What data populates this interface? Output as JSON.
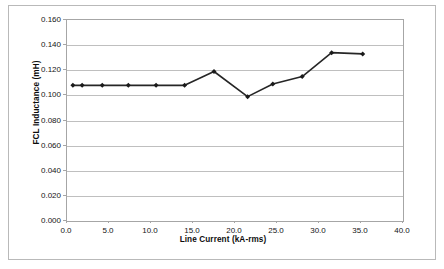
{
  "chart_data": {
    "type": "line",
    "title": "",
    "xlabel": "Line Current (kA-rms)",
    "ylabel": "FCL Inductance (mH)",
    "xlim": [
      0.0,
      40.0
    ],
    "ylim": [
      0.0,
      0.16
    ],
    "xticks": [
      "0.0",
      "5.0",
      "10.0",
      "15.0",
      "20.0",
      "25.0",
      "30.0",
      "35.0",
      "40.0"
    ],
    "xtick_values": [
      0.0,
      5.0,
      10.0,
      15.0,
      20.0,
      25.0,
      30.0,
      35.0,
      40.0
    ],
    "yticks": [
      "0.000",
      "0.020",
      "0.040",
      "0.060",
      "0.080",
      "0.100",
      "0.120",
      "0.140",
      "0.160"
    ],
    "ytick_values": [
      0.0,
      0.02,
      0.04,
      0.06,
      0.08,
      0.1,
      0.12,
      0.14,
      0.16
    ],
    "grid": "horizontal",
    "legend": "none",
    "marker": "diamond",
    "line_color": "#262626",
    "marker_color": "#1a1a1a",
    "gridline_color": "#bfbfbf",
    "series": [
      {
        "name": "FCL Inductance",
        "x": [
          0.7,
          1.8,
          4.2,
          7.3,
          10.6,
          14.0,
          17.5,
          21.5,
          24.5,
          28.0,
          31.5,
          35.2
        ],
        "values": [
          0.108,
          0.108,
          0.108,
          0.108,
          0.108,
          0.108,
          0.119,
          0.099,
          0.109,
          0.115,
          0.134,
          0.133
        ]
      }
    ]
  }
}
